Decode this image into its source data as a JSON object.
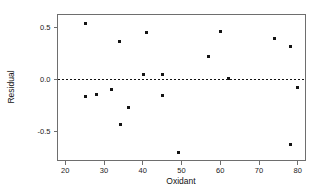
{
  "chart_data": {
    "type": "scatter",
    "title": "",
    "xlabel": "Oxidant",
    "ylabel": "Residual",
    "xlim": [
      18,
      82
    ],
    "ylim": [
      -0.78,
      0.62
    ],
    "xticks": [
      20,
      30,
      40,
      50,
      60,
      70,
      80
    ],
    "xtick_labels": [
      "20",
      "30",
      "40",
      "50",
      "60",
      "70",
      "80"
    ],
    "yticks": [
      0.5,
      0.0,
      -0.5
    ],
    "ytick_labels": [
      "0.5",
      "0.0",
      "-0.5"
    ],
    "grid": false,
    "legend": false,
    "reference_line": {
      "orientation": "horizontal",
      "value": 0.0,
      "style": "dashed"
    },
    "marker": {
      "shape": "square",
      "color": "#141414",
      "size": 3
    },
    "points": [
      {
        "x": 25.1,
        "y": 0.53
      },
      {
        "x": 25.3,
        "y": -0.17
      },
      {
        "x": 28.0,
        "y": -0.145
      },
      {
        "x": 32.0,
        "y": -0.1
      },
      {
        "x": 34.1,
        "y": 0.36
      },
      {
        "x": 34.3,
        "y": -0.43
      },
      {
        "x": 36.2,
        "y": -0.275
      },
      {
        "x": 40.2,
        "y": 0.045
      },
      {
        "x": 41.0,
        "y": 0.445
      },
      {
        "x": 45.0,
        "y": 0.045
      },
      {
        "x": 45.2,
        "y": -0.155
      },
      {
        "x": 49.1,
        "y": -0.7
      },
      {
        "x": 57.0,
        "y": 0.215
      },
      {
        "x": 60.0,
        "y": 0.455
      },
      {
        "x": 62.0,
        "y": 0.01
      },
      {
        "x": 74.0,
        "y": 0.39
      },
      {
        "x": 78.0,
        "y": 0.31
      },
      {
        "x": 78.2,
        "y": -0.63
      },
      {
        "x": 80.0,
        "y": -0.08
      }
    ]
  },
  "colors": {
    "axis": "#6e6e6e",
    "marker": "#141414",
    "zero_line": "#111111",
    "background": "#ffffff"
  }
}
